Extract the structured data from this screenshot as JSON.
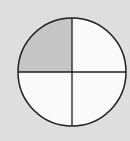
{
  "diagram": {
    "type": "fraction-circle",
    "parts_total": 4,
    "parts_shaded": 1,
    "shaded_part": "top-left",
    "fraction": "1/4",
    "center": [
      72,
      72
    ],
    "radius": 54,
    "colors": {
      "background": "#dedede",
      "shaded": "#c6c6c6",
      "unshaded": "#fafafa",
      "stroke": "#1e1e1e"
    }
  }
}
